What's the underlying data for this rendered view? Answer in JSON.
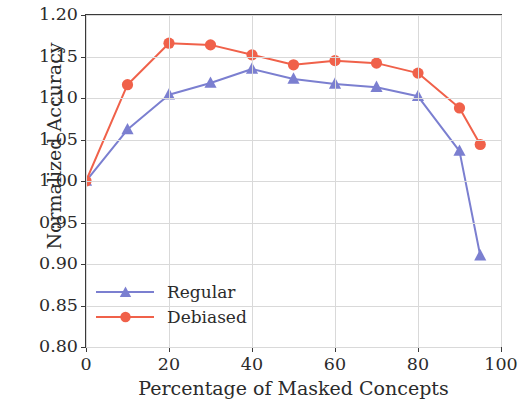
{
  "chart_data": {
    "type": "line",
    "title": "",
    "xlabel": "Percentage of Masked Concepts",
    "ylabel": "Normalized Accuracy",
    "xlim": [
      0,
      100
    ],
    "ylim": [
      0.8,
      1.2
    ],
    "grid": true,
    "legend_position": "lower left",
    "x": [
      0,
      10,
      20,
      30,
      40,
      50,
      60,
      70,
      80,
      90,
      95
    ],
    "xticks": [
      "0",
      "20",
      "40",
      "60",
      "80",
      "100"
    ],
    "xtick_values": [
      0,
      20,
      40,
      60,
      80,
      100
    ],
    "yticks": [
      "0.80",
      "0.85",
      "0.90",
      "0.95",
      "1.00",
      "1.05",
      "1.10",
      "1.15",
      "1.20"
    ],
    "ytick_values": [
      0.8,
      0.85,
      0.9,
      0.95,
      1.0,
      1.05,
      1.1,
      1.15,
      1.2
    ],
    "series": [
      {
        "name": "Regular",
        "color": "#7b7fd0",
        "marker": "triangle",
        "values": [
          1.0,
          1.062,
          1.104,
          1.118,
          1.135,
          1.123,
          1.117,
          1.113,
          1.102,
          1.036,
          0.91
        ]
      },
      {
        "name": "Debiased",
        "color": "#f0614a",
        "marker": "circle",
        "values": [
          1.0,
          1.116,
          1.166,
          1.164,
          1.152,
          1.14,
          1.145,
          1.142,
          1.13,
          1.088,
          1.044
        ]
      }
    ]
  },
  "legend": {
    "entries": [
      {
        "label": "Regular"
      },
      {
        "label": "Debiased"
      }
    ]
  },
  "colors": {
    "regular": "#7b7fd0",
    "debiased": "#f0614a",
    "axis": "#3a3a3a",
    "grid": "#d9d9d9",
    "text": "#2b2b2b"
  }
}
